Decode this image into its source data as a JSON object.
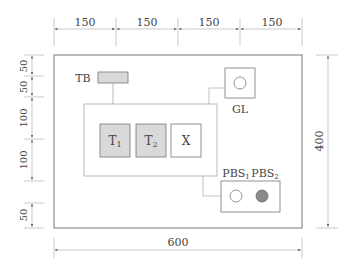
{
  "diagram": {
    "top_dimensions": [
      "150",
      "150",
      "150",
      "150"
    ],
    "left_dimensions": [
      "50",
      "50",
      "100",
      "100",
      "50"
    ],
    "right_dimension": "400",
    "bottom_dimension": "600",
    "components": {
      "tb": {
        "label": "TB"
      },
      "t1": {
        "label": "T",
        "sub": "1"
      },
      "t2": {
        "label": "T",
        "sub": "2"
      },
      "x": {
        "label": "X"
      },
      "gl": {
        "label": "GL"
      },
      "pbs1": {
        "label": "PBS",
        "sub": "1"
      },
      "pbs2": {
        "label": "PBS",
        "sub": "2"
      }
    },
    "colors": {
      "line": "#777777",
      "dim_line": "#999999",
      "box_fill_gray": "#d9d9d9",
      "pbs2_fill": "#8a8a8a"
    }
  }
}
